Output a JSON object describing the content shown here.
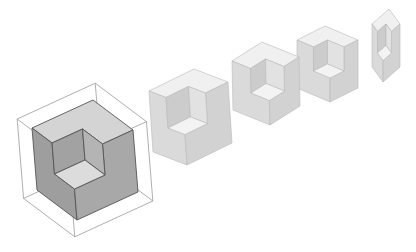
{
  "figure": {
    "background": "#ffffff",
    "notch_fraction": 0.5,
    "stroke_color": "#8a8a8a",
    "cubes": [
      {
        "name": "cube-1-highlighted",
        "B": [
          77,
          220
        ],
        "u": [
          -40,
          -30
        ],
        "v": [
          61,
          -28
        ],
        "w": [
          -5,
          -62
        ],
        "colors": {
          "top": "#d4d4d4",
          "left": "#9e9e9e",
          "right": "#a8a8a8",
          "floor": "#dcdcdc",
          "wall_l": "#b4b4b4",
          "wall_r": "#a2a2a2"
        },
        "stroke": "#555555",
        "wireframe": {
          "scale": 1.28,
          "color": "#9a9a9a"
        }
      },
      {
        "name": "cube-2",
        "B": [
          187,
          165
        ],
        "u": [
          -34,
          -13
        ],
        "v": [
          45,
          -22
        ],
        "w": [
          -4,
          -61
        ],
        "colors": {
          "top": "#f0f0f0",
          "left": "#dadada",
          "right": "#d2d2d2",
          "floor": "#f3f3f3",
          "wall_l": "#e2e2e2",
          "wall_r": "#cccccc"
        },
        "stroke": "#b8b8b8"
      },
      {
        "name": "cube-3",
        "B": [
          270,
          125
        ],
        "u": [
          -37,
          -15
        ],
        "v": [
          30,
          -19
        ],
        "w": [
          -1,
          -49
        ],
        "colors": {
          "top": "#f0f0f0",
          "left": "#dadada",
          "right": "#d2d2d2",
          "floor": "#f3f3f3",
          "wall_l": "#e2e2e2",
          "wall_r": "#cccccc"
        },
        "stroke": "#b8b8b8"
      },
      {
        "name": "cube-4",
        "B": [
          330,
          102
        ],
        "u": [
          -33,
          -14
        ],
        "v": [
          28,
          -14
        ],
        "w": [
          0,
          -48
        ],
        "colors": {
          "top": "#f0f0f0",
          "left": "#dadada",
          "right": "#d2d2d2",
          "floor": "#f3f3f3",
          "wall_l": "#e2e2e2",
          "wall_r": "#cccccc"
        },
        "stroke": "#b8b8b8"
      },
      {
        "name": "cube-5",
        "B": [
          383,
          82
        ],
        "u": [
          -11,
          -15
        ],
        "v": [
          17,
          -15
        ],
        "w": [
          0,
          -43
        ],
        "colors": {
          "top": "#f0f0f0",
          "left": "#dadada",
          "right": "#d2d2d2",
          "floor": "#f3f3f3",
          "wall_l": "#e2e2e2",
          "wall_r": "#cccccc"
        },
        "stroke": "#b8b8b8"
      }
    ]
  }
}
